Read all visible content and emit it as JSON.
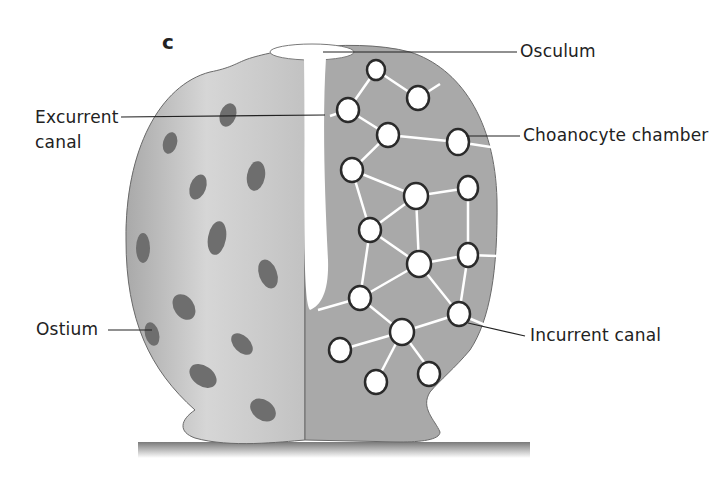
{
  "diagram": {
    "panel_letter": "c",
    "colors": {
      "outer_body": "#c8c8c8",
      "cut_section": "#a9a9a9",
      "ostium_spot": "#6e6e6e",
      "canal": "#ffffff",
      "chamber_outline": "#2a2a2a",
      "leader_line": "#222222",
      "substrate": "#8a8a8a"
    },
    "labels": [
      {
        "id": "osculum",
        "text": "Osculum"
      },
      {
        "id": "excurrent-canal",
        "line1": "Excurrent",
        "line2": "canal"
      },
      {
        "id": "choanocyte-chamber",
        "text": "Choanocyte chamber"
      },
      {
        "id": "ostium",
        "text": "Ostium"
      },
      {
        "id": "incurrent-canal",
        "text": "Incurrent canal"
      }
    ]
  }
}
